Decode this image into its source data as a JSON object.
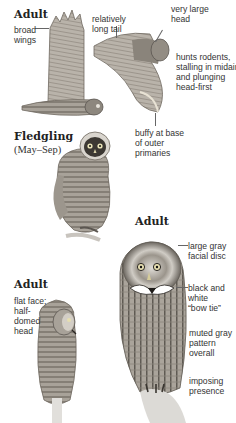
{
  "sections": {
    "adult_flight": {
      "heading": "Adult",
      "labels": {
        "broad_wings": [
          "broad",
          "wings"
        ],
        "long_tail": [
          "relatively",
          "long tail"
        ],
        "large_head": [
          "very large",
          "head"
        ],
        "hunts": [
          "hunts rodents,",
          "stalling in midair",
          "and plunging",
          "head-first"
        ],
        "buffy": [
          "buffy at base",
          "of outer",
          "primaries"
        ]
      }
    },
    "fledgling": {
      "heading": "Fledgling",
      "subheading": "(May–Sep)"
    },
    "adult_front": {
      "heading": "Adult",
      "labels": {
        "facial_disc": [
          "large gray",
          "facial disc"
        ],
        "bow_tie": [
          "black and",
          "white",
          "“bow tie”"
        ],
        "muted": [
          "muted gray",
          "pattern",
          "overall"
        ],
        "imposing": [
          "imposing",
          "presence"
        ]
      }
    },
    "adult_side": {
      "heading": "Adult",
      "labels": {
        "flat_face": [
          "flat face;",
          "half-",
          "domed",
          "head"
        ]
      }
    }
  },
  "colors": {
    "ink": "#2a2a2a",
    "plumage_light": "#c9c4bc",
    "plumage_mid": "#9a948b",
    "plumage_dark": "#5b5650",
    "perch": "#d8d6d2"
  }
}
